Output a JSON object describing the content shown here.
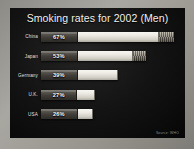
{
  "slide": {
    "title": "Smoking rates for 2002 (Men)",
    "source_note": "Source: WHO",
    "frame_color": "#9a9892",
    "panel_color": "#141414",
    "title_color": "#f2f0ea",
    "label_color": "#e9e7e1",
    "value_color": "#fbfaf6",
    "filter_color": "#403d38",
    "paper_color": "#eceae3",
    "ash_color": "#6a6459"
  },
  "chart_data": {
    "type": "bar",
    "orientation": "horizontal",
    "title": "Smoking rates for 2002 (Men)",
    "xlabel": "",
    "ylabel": "",
    "xlim": [
      0,
      70
    ],
    "grid": false,
    "legend": "none",
    "value_suffix": "%",
    "categories": [
      "China",
      "Japan",
      "Germany",
      "U.K.",
      "USA"
    ],
    "values": [
      67,
      53,
      39,
      27,
      26
    ],
    "labels": [
      "67%",
      "53%",
      "39%",
      "27%",
      "26%"
    ],
    "bars": [
      {
        "category": "China",
        "value": 67,
        "label": "67%",
        "has_ash_tip": true,
        "filter_pct": 27,
        "ash_pct": 11
      },
      {
        "category": "Japan",
        "value": 53,
        "label": "53%",
        "has_ash_tip": true,
        "filter_pct": 34,
        "ash_pct": 13
      },
      {
        "category": "Germany",
        "value": 39,
        "label": "39%",
        "has_ash_tip": false,
        "filter_pct": 46,
        "ash_pct": 0
      },
      {
        "category": "U.K.",
        "value": 27,
        "label": "27%",
        "has_ash_tip": false,
        "filter_pct": 66,
        "ash_pct": 0
      },
      {
        "category": "USA",
        "value": 26,
        "label": "26%",
        "has_ash_tip": false,
        "filter_pct": 69,
        "ash_pct": 0
      }
    ],
    "annotation": "Bars are drawn as cigarettes; the lit ash tip appears on the two longest bars."
  }
}
